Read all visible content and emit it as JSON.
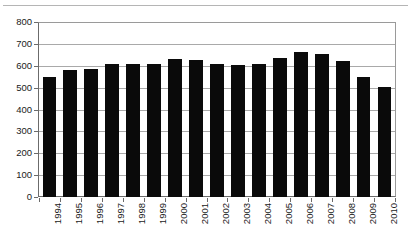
{
  "chart_data": {
    "type": "bar",
    "title": "",
    "subtitle": "",
    "xlabel": "",
    "ylabel": "",
    "categories": [
      "1994",
      "1995",
      "1996",
      "1997",
      "1998",
      "1999",
      "2000",
      "2001",
      "2002",
      "2003",
      "2004",
      "2005",
      "2006",
      "2007",
      "2008",
      "2009",
      "2010"
    ],
    "values": [
      550,
      580,
      585,
      610,
      608,
      608,
      630,
      625,
      608,
      605,
      608,
      635,
      662,
      655,
      620,
      550,
      505
    ],
    "series": [
      {
        "name": "",
        "values": [
          550,
          580,
          585,
          610,
          608,
          608,
          630,
          625,
          608,
          605,
          608,
          635,
          662,
          655,
          620,
          550,
          505
        ]
      }
    ],
    "ylim": [
      0,
      800
    ],
    "ytick_labels": [
      "800",
      "700",
      "600",
      "500",
      "400",
      "300",
      "200",
      "100",
      "0"
    ],
    "ytick_values": [
      800,
      700,
      600,
      500,
      400,
      300,
      200,
      100,
      0
    ],
    "grid": true,
    "grid_axis": "y",
    "legend": false,
    "legend_position": "none",
    "bar_color": "#0a0a0a",
    "grid_color": "#a9a9a9",
    "axis_color": "#6b6b6b",
    "background_color": "#ffffff",
    "annotations": []
  }
}
